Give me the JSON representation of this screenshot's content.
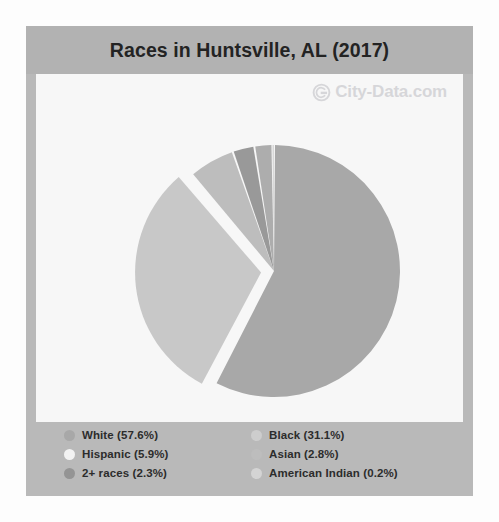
{
  "title": "Races in Huntsville, AL (2017)",
  "watermark": {
    "text": "City-Data.com",
    "logo_icon": "city-data-circle-logo-icon"
  },
  "colors": {
    "page_background": "#fdfdfd",
    "card_background": "#b9b9b9",
    "title_band": "#b2b2b2",
    "plot_background": "#f7f7f7",
    "slice_white": "#a8a8a8",
    "slice_black": "#c8c8c8",
    "slice_hispanic": "#bdbdbd",
    "slice_asian": "#999999",
    "slice_2plus": "#adadad",
    "slice_american_indian": "#d8d8d8",
    "text": "#2c2c2c"
  },
  "legend": {
    "columns": [
      {
        "items": [
          {
            "label": "White (57.6%)",
            "swatch": "#a8a8a8",
            "swatch_name": "legend-swatch-white"
          },
          {
            "label": "Hispanic (5.9%)",
            "swatch": "#f2f2f2",
            "swatch_name": "legend-swatch-hispanic"
          },
          {
            "label": "2+ races (2.3%)",
            "swatch": "#949494",
            "swatch_name": "legend-swatch-2plus-races"
          }
        ]
      },
      {
        "items": [
          {
            "label": "Black (31.1%)",
            "swatch": "#cdcdcd",
            "swatch_name": "legend-swatch-black"
          },
          {
            "label": "Asian (2.8%)",
            "swatch": "#bdbdbd",
            "swatch_name": "legend-swatch-asian"
          },
          {
            "label": "American Indian (0.2%)",
            "swatch": "#d4d4d4",
            "swatch_name": "legend-swatch-american-indian"
          }
        ]
      }
    ]
  },
  "chart_data": {
    "type": "pie",
    "title": "Races in Huntsville, AL (2017)",
    "xlabel": "",
    "ylabel": "",
    "legend_position": "bottom",
    "grid": false,
    "start_angle_deg": 0,
    "direction": "clockwise",
    "categories": [
      "White",
      "Black",
      "Hispanic",
      "Asian",
      "2+ races",
      "American Indian"
    ],
    "values": [
      57.6,
      31.1,
      5.9,
      2.8,
      2.3,
      0.2
    ],
    "unit": "%",
    "labels": [
      "White (57.6%)",
      "Black (31.1%)",
      "Hispanic (5.9%)",
      "Asian (2.8%)",
      "2+ races (2.3%)",
      "American Indian (0.2%)"
    ],
    "slice_colors": [
      "#a8a8a8",
      "#c8c8c8",
      "#bdbdbd",
      "#999999",
      "#adadad",
      "#d8d8d8"
    ],
    "exploded": [
      "Black"
    ],
    "total": 99.9
  }
}
